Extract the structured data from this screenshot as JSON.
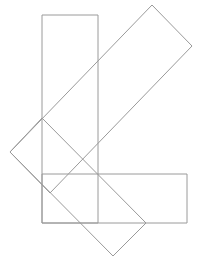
{
  "diagram": {
    "width": 212,
    "height": 258,
    "background": "#ffffff",
    "stroke_color": "#9a9a9a",
    "stroke_width": 1,
    "shapes": [
      {
        "name": "vertical-rectangle",
        "type": "polygon",
        "points": [
          [
            42,
            15
          ],
          [
            98,
            15
          ],
          [
            98,
            223
          ],
          [
            42,
            223
          ]
        ]
      },
      {
        "name": "horizontal-rectangle",
        "type": "polygon",
        "points": [
          [
            42,
            174
          ],
          [
            187,
            174
          ],
          [
            187,
            223
          ],
          [
            42,
            223
          ]
        ]
      },
      {
        "name": "rotated-rectangle-upper",
        "type": "polygon",
        "points": [
          [
            10,
            152
          ],
          [
            152,
            5
          ],
          [
            192,
            46
          ],
          [
            50,
            193
          ]
        ]
      },
      {
        "name": "rotated-rectangle-lower",
        "type": "polygon",
        "points": [
          [
            42,
            118
          ],
          [
            146,
            223
          ],
          [
            113,
            256
          ],
          [
            10,
            152
          ]
        ]
      }
    ]
  }
}
